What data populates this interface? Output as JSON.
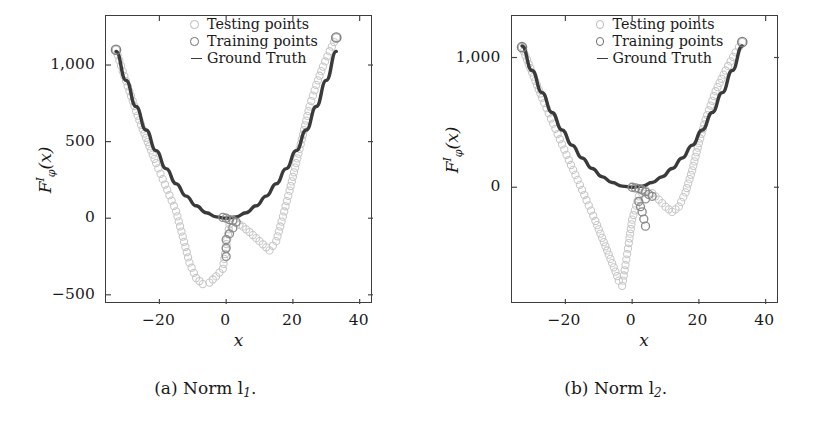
{
  "figure": {
    "panels": [
      {
        "id": "panel-a",
        "caption": "(a) Norm l",
        "caption_sub": "1",
        "caption_end": ".",
        "legend": {
          "testing": "Testing points",
          "training": "Training points",
          "ground_truth": "Ground Truth"
        },
        "axis": {
          "xlabel": "x",
          "ylabel_base": "F",
          "ylabel_sup": "I",
          "ylabel_sub": "φ",
          "ylabel_arg": "(x)",
          "xticks": [
            "−20",
            "0",
            "20",
            "40"
          ],
          "xtick_values": [
            -20,
            0,
            20,
            40
          ],
          "yticks": [
            "1,000",
            "500",
            "0",
            "−500"
          ],
          "ytick_values": [
            1000,
            500,
            0,
            -500
          ],
          "xlim": [
            -36,
            44
          ],
          "ylim": [
            -560,
            1320
          ]
        },
        "chart_data": {
          "type": "scatter",
          "title": "(a) Norm l1",
          "xlabel": "x",
          "ylabel": "F^I_phi(x)",
          "xlim": [
            -36,
            44
          ],
          "ylim": [
            -560,
            1320
          ],
          "grid": false,
          "legend_position": "top-center",
          "series": [
            {
              "name": "Ground Truth",
              "type": "line",
              "color": "#3a3a3a",
              "comment": "dark parabola approx y = x^2, drawn as thick line",
              "x": [
                -33,
                -30,
                -27,
                -24,
                -21,
                -18,
                -15,
                -12,
                -9,
                -6,
                -3,
                0,
                3,
                6,
                9,
                12,
                15,
                18,
                21,
                24,
                27,
                30,
                33
              ],
              "y": [
                1089,
                900,
                729,
                576,
                441,
                324,
                225,
                144,
                81,
                36,
                9,
                0,
                9,
                36,
                81,
                144,
                225,
                324,
                441,
                576,
                729,
                900,
                1089
              ]
            },
            {
              "name": "Testing points",
              "type": "scatter",
              "color": "#c6c6c6",
              "comment": "dense light circles: match truth at extremes, sag below zero between -20 and +14",
              "x": [
                -33,
                -31,
                -29,
                -27,
                -25,
                -23,
                -21,
                -19,
                -17,
                -15,
                -13,
                -11,
                -9,
                -7,
                -5,
                -3,
                -1,
                1,
                3,
                5,
                7,
                9,
                11,
                13,
                15,
                17,
                19,
                21,
                23,
                25,
                27,
                29,
                31,
                33
              ],
              "y": [
                1100,
                960,
                830,
                700,
                580,
                470,
                360,
                255,
                150,
                45,
                -120,
                -290,
                -390,
                -430,
                -420,
                -380,
                -330,
                -40,
                -30,
                -55,
                -90,
                -130,
                -170,
                -210,
                -150,
                10,
                180,
                360,
                545,
                730,
                870,
                990,
                1090,
                1180
              ]
            },
            {
              "name": "Training points",
              "type": "scatter",
              "color": "#8a8a8a",
              "comment": "darker circles clustered near x=0 and two isolated low points",
              "x": [
                -1,
                0,
                1,
                2,
                3,
                0,
                0
              ],
              "y": [
                5,
                0,
                -10,
                -15,
                -25,
                -140,
                -250
              ]
            }
          ]
        }
      },
      {
        "id": "panel-b",
        "caption": "(b) Norm l",
        "caption_sub": "2",
        "caption_end": ".",
        "legend": {
          "testing": "Testing points",
          "training": "Training points",
          "ground_truth": "Ground Truth"
        },
        "axis": {
          "xlabel": "x",
          "ylabel_base": "F",
          "ylabel_sup": "I",
          "ylabel_sub": "φ",
          "ylabel_arg": "(x)",
          "xticks": [
            "−20",
            "0",
            "20",
            "40"
          ],
          "xtick_values": [
            -20,
            0,
            20,
            40
          ],
          "yticks": [
            "1,000",
            "0"
          ],
          "ytick_values": [
            1000,
            0
          ],
          "xlim": [
            -36,
            44
          ],
          "ylim": [
            -900,
            1320
          ]
        },
        "chart_data": {
          "type": "scatter",
          "title": "(b) Norm l2",
          "xlabel": "x",
          "ylabel": "F^I_phi(x)",
          "xlim": [
            -36,
            44
          ],
          "ylim": [
            -900,
            1320
          ],
          "grid": false,
          "legend_position": "top-center",
          "series": [
            {
              "name": "Ground Truth",
              "type": "line",
              "color": "#3a3a3a",
              "x": [
                -33,
                -30,
                -27,
                -24,
                -21,
                -18,
                -15,
                -12,
                -9,
                -6,
                -3,
                0,
                3,
                6,
                9,
                12,
                15,
                18,
                21,
                24,
                27,
                30,
                33
              ],
              "y": [
                1089,
                900,
                729,
                576,
                441,
                324,
                225,
                144,
                81,
                36,
                9,
                0,
                9,
                36,
                81,
                144,
                225,
                324,
                441,
                576,
                729,
                900,
                1089
              ]
            },
            {
              "name": "Testing points",
              "type": "scatter",
              "color": "#c6c6c6",
              "comment": "steep left branch plunging to a sharp V near x=-3, then rising",
              "x": [
                -33,
                -31,
                -29,
                -27,
                -25,
                -23,
                -21,
                -19,
                -17,
                -15,
                -13,
                -11,
                -9,
                -7,
                -5,
                -4,
                -3,
                -2,
                -1,
                0,
                2,
                4,
                6,
                8,
                10,
                12,
                14,
                16,
                18,
                20,
                22,
                25,
                28,
                31,
                33
              ],
              "y": [
                1080,
                950,
                820,
                690,
                570,
                450,
                330,
                210,
                95,
                -20,
                -140,
                -260,
                -390,
                -520,
                -650,
                -720,
                -760,
                -600,
                -430,
                -250,
                -70,
                -20,
                -45,
                -95,
                -150,
                -190,
                -150,
                -40,
                130,
                340,
                520,
                740,
                900,
                1040,
                1120
              ]
            },
            {
              "name": "Training points",
              "type": "scatter",
              "color": "#8a8a8a",
              "x": [
                0,
                1,
                2,
                3,
                4,
                5,
                6,
                2,
                3,
                4
              ],
              "y": [
                0,
                -5,
                -10,
                -20,
                -35,
                -55,
                -70,
                -110,
                -190,
                -300
              ]
            }
          ]
        }
      }
    ]
  }
}
